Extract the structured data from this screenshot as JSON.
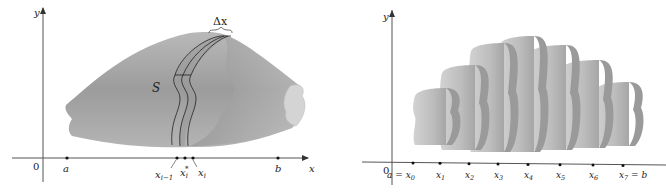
{
  "left_figure": {
    "axis_y_label": "y",
    "axis_x_label": "x",
    "origin_label": "0",
    "solid_label": "S",
    "slab_width_label": "Δx",
    "points": [
      {
        "name": "a",
        "label": "a"
      },
      {
        "name": "x-i-minus-1",
        "label": "x",
        "sub": "i−1"
      },
      {
        "name": "x-i-star",
        "label": "x",
        "sub": "i",
        "sup": "*"
      },
      {
        "name": "x-i",
        "label": "x",
        "sub": "i"
      },
      {
        "name": "b",
        "label": "b"
      }
    ]
  },
  "right_figure": {
    "axis_y_label": "y",
    "axis_x_label": "x",
    "origin_label": "0",
    "points": [
      {
        "label": "x",
        "sub": "0",
        "prefix": "a = "
      },
      {
        "label": "x",
        "sub": "1"
      },
      {
        "label": "x",
        "sub": "2"
      },
      {
        "label": "x",
        "sub": "3"
      },
      {
        "label": "x",
        "sub": "4"
      },
      {
        "label": "x",
        "sub": "5"
      },
      {
        "label": "x",
        "sub": "6"
      },
      {
        "label": "x",
        "sub": "7",
        "suffix": " = b"
      }
    ],
    "slab_count": 7
  },
  "colors": {
    "solid_light": "#c9c9c9",
    "solid_mid": "#a8a8a8",
    "solid_dark": "#8a8a8a",
    "slab_highlight": "#7d7d7d",
    "axis": "#555555"
  }
}
